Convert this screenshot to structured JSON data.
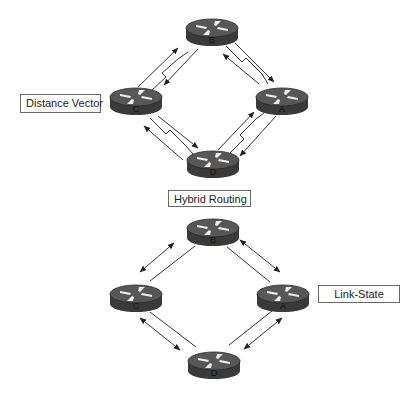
{
  "labels": {
    "distance_vector": "Distance Vector",
    "hybrid_routing": "Hybrid Routing",
    "link_state": "Link-State"
  },
  "top_network": {
    "protocol": "Distance Vector",
    "link_style": "serial-lightning",
    "routers": [
      {
        "id": "B",
        "label": "B"
      },
      {
        "id": "C",
        "label": "C"
      },
      {
        "id": "A",
        "label": "A"
      },
      {
        "id": "D",
        "label": "D"
      }
    ],
    "links": [
      {
        "from": "C",
        "to": "B"
      },
      {
        "from": "B",
        "to": "A"
      },
      {
        "from": "C",
        "to": "D"
      },
      {
        "from": "D",
        "to": "A"
      }
    ]
  },
  "bottom_network": {
    "protocol": "Link-State",
    "link_style": "straight",
    "routers": [
      {
        "id": "B",
        "label": "B"
      },
      {
        "id": "C",
        "label": "C"
      },
      {
        "id": "A",
        "label": "A"
      },
      {
        "id": "D",
        "label": "D"
      }
    ],
    "links": [
      {
        "from": "C",
        "to": "B"
      },
      {
        "from": "B",
        "to": "A"
      },
      {
        "from": "C",
        "to": "D"
      },
      {
        "from": "D",
        "to": "A"
      }
    ]
  },
  "colors": {
    "router_body": "#3f3f3f",
    "router_top": "#5a5a5a",
    "router_arrows": "#e8e8e8",
    "line": "#333333"
  }
}
